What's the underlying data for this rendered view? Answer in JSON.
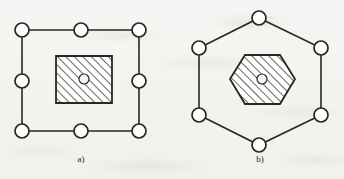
{
  "figure": {
    "background_color": "#f4f2ef",
    "ink_color": "#2b2622",
    "node_fill_color": "#ffffff",
    "hatch_color": "#3a3430",
    "panels": [
      {
        "id": "panel-a",
        "caption": "a)",
        "caption_x": 81,
        "caption_y": 154,
        "outline_shape": "square",
        "core_shape": "square",
        "node_count": 8,
        "node_radius": 7,
        "center_hole_radius": 5,
        "nodes": [
          {
            "label": "top-left",
            "x": 22,
            "y": 30
          },
          {
            "label": "top-center",
            "x": 81,
            "y": 30
          },
          {
            "label": "top-right",
            "x": 139,
            "y": 30
          },
          {
            "label": "middle-left",
            "x": 22,
            "y": 81
          },
          {
            "label": "middle-right",
            "x": 139,
            "y": 81
          },
          {
            "label": "bottom-left",
            "x": 22,
            "y": 131
          },
          {
            "label": "bottom-center",
            "x": 81,
            "y": 131
          },
          {
            "label": "bottom-right",
            "x": 139,
            "y": 131
          }
        ],
        "outline_path": "M22,30 L139,30 L139,131 L22,131 Z",
        "core_path": "M56,56 L112,56 L112,103 L56,103 Z",
        "core_center": {
          "x": 84,
          "y": 79
        }
      },
      {
        "id": "panel-b",
        "caption": "b)",
        "caption_x": 260,
        "caption_y": 154,
        "outline_shape": "hexagon",
        "core_shape": "hexagon",
        "node_count": 6,
        "node_radius": 7,
        "center_hole_radius": 5,
        "nodes": [
          {
            "label": "top",
            "x": 259,
            "y": 18
          },
          {
            "label": "upper-left",
            "x": 199,
            "y": 48
          },
          {
            "label": "upper-right",
            "x": 321,
            "y": 48
          },
          {
            "label": "lower-left",
            "x": 199,
            "y": 115
          },
          {
            "label": "lower-right",
            "x": 321,
            "y": 115
          },
          {
            "label": "bottom",
            "x": 259,
            "y": 145
          }
        ],
        "outline_path": "M259,18 L321,48 L321,115 L259,145 L199,115 L199,48 Z",
        "core_path": "M245,55 L280,55 L295,79 L280,104 L245,104 L230,79 Z",
        "core_center": {
          "x": 262,
          "y": 79
        }
      }
    ]
  }
}
